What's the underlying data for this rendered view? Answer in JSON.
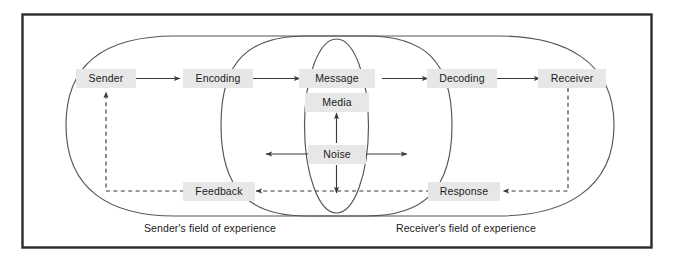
{
  "diagram": {
    "frame": {
      "border_color": "#2b2b2b",
      "background": "#ffffff"
    },
    "colors": {
      "label_background": "#e7e7e7",
      "text": "#1a1a1a",
      "line": "#3a3a3a",
      "ellipse_stroke": "#555555"
    },
    "nodes": {
      "sender": "Sender",
      "encoding": "Encoding",
      "message": "Message",
      "media": "Media",
      "noise": "Noise",
      "decoding": "Decoding",
      "receiver": "Receiver",
      "feedback": "Feedback",
      "response": "Response"
    },
    "captions": {
      "sender_field": "Sender's field of experience",
      "receiver_field": "Receiver's field of experience"
    },
    "flows": [
      {
        "from": "Sender",
        "to": "Encoding",
        "style": "solid"
      },
      {
        "from": "Encoding",
        "to": "Message",
        "style": "solid"
      },
      {
        "from": "Message",
        "to": "Decoding",
        "style": "solid"
      },
      {
        "from": "Decoding",
        "to": "Receiver",
        "style": "solid"
      },
      {
        "from": "Receiver",
        "to": "Response",
        "style": "dashed"
      },
      {
        "from": "Response",
        "to": "Feedback",
        "style": "dashed"
      },
      {
        "from": "Feedback",
        "to": "Sender",
        "style": "dashed"
      },
      {
        "from": "Noise",
        "to": "Media",
        "style": "solid"
      },
      {
        "from": "Noise",
        "to": "down",
        "style": "solid"
      },
      {
        "from": "Noise",
        "to": "left",
        "style": "solid"
      },
      {
        "from": "Noise",
        "to": "right",
        "style": "solid"
      }
    ]
  }
}
